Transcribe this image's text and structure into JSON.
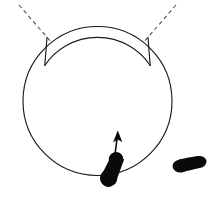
{
  "figure": {
    "width": 218,
    "height": 199,
    "background_color": "#ffffff",
    "line_color": "#1a1a1a",
    "dashed_line_color": "#4a4a4a",
    "filled_shape_color": "#0a0a0a"
  },
  "arena": {
    "name": "outer-circle",
    "center_x": 97.5,
    "center_y": 101,
    "radius": 74.5,
    "stroke_width": 1.15
  },
  "inner_arc": {
    "name": "inner-arc-segment",
    "center_x": 97.5,
    "center_y": 101,
    "radius": 63.5,
    "start_angle_deg": 214,
    "end_angle_deg": 326,
    "description": "shorter concentric arc spanning the top of the arena forming a band"
  },
  "radial_connectors": [
    {
      "name": "radial-connector-left",
      "x1": 48.0,
      "y1": 38.0,
      "x2": 56.2,
      "y2": 49.5
    },
    {
      "name": "radial-connector-right",
      "x1": 147.0,
      "y1": 38.0,
      "x2": 138.8,
      "y2": 49.5
    }
  ],
  "dashed_cues": [
    {
      "name": "dashed-cue-left",
      "x1": 19.0,
      "y1": 5.0,
      "x2": 52.0,
      "y2": 43.0,
      "dash_pattern": "4 3.2"
    },
    {
      "name": "dashed-cue-right",
      "x1": 176.0,
      "y1": 5.0,
      "x2": 143.0,
      "y2": 43.0,
      "dash_pattern": "4 3.2"
    }
  ],
  "subject": {
    "name": "subject-foot-shape",
    "center_x": 113.0,
    "center_y": 169.5,
    "length": 36.0,
    "width": 17.0,
    "rotation_deg": -65,
    "position_note": "on the lower boundary of the circle"
  },
  "heading_arrow": {
    "name": "heading-arrow",
    "tail_x": 114.5,
    "tail_y": 158.0,
    "tip_x": 117.5,
    "tip_y": 131.0,
    "direction": "up",
    "label": ""
  },
  "second_shape": {
    "name": "reference-foot-shape",
    "center_x": 190.0,
    "center_y": 164.0,
    "length": 34.0,
    "width": 14.0,
    "rotation_deg": -8,
    "position_note": "outside the circle, lower right"
  },
  "labels": {
    "visible_text": []
  }
}
